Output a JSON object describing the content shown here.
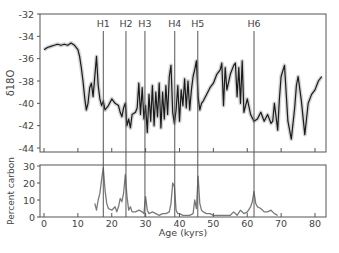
{
  "chart_data": [
    {
      "type": "line",
      "panel": "top",
      "title": "",
      "xlabel": "",
      "ylabel": "δ18O",
      "xlim": [
        0,
        83
      ],
      "ylim": [
        -44.5,
        -32
      ],
      "y_ticks": [
        -32,
        -34,
        -36,
        -38,
        -40,
        -42,
        -44
      ],
      "y_tick_labels": [
        "-32",
        "-34",
        "-36",
        "-38",
        "-40",
        "-42",
        "-44"
      ],
      "grid": false,
      "series": [
        {
          "name": "δ18O",
          "x": [
            0,
            1,
            2,
            3,
            4,
            5,
            6,
            7,
            8,
            9,
            10,
            10.5,
            11,
            11.5,
            12,
            12.5,
            13,
            13.5,
            14,
            14.5,
            15,
            15.5,
            16,
            16.5,
            17,
            17.5,
            18,
            19,
            20,
            21,
            22,
            22.5,
            23,
            23.5,
            24,
            24.5,
            25,
            25.5,
            26,
            27,
            27.5,
            28,
            28.5,
            29,
            29.5,
            30,
            30.5,
            31,
            31.5,
            32,
            32.5,
            33,
            33.5,
            34,
            34.5,
            35,
            35.5,
            36,
            36.5,
            37,
            37.5,
            38,
            38.5,
            39,
            39.5,
            40,
            40.5,
            41,
            41.5,
            42,
            42.5,
            43,
            43.5,
            44,
            44.5,
            45,
            45.5,
            46,
            46.5,
            47,
            48,
            49,
            50,
            51,
            52,
            52.5,
            53,
            53.5,
            54,
            55,
            56,
            56.5,
            57,
            57.5,
            58,
            58.5,
            59,
            60,
            61,
            62,
            63,
            64,
            65,
            66,
            67,
            67.5,
            68,
            69,
            69.5,
            70,
            71,
            72,
            73,
            74,
            74.5,
            75,
            76,
            77,
            78,
            79,
            80,
            81,
            82
          ],
          "values": [
            -35.2,
            -35.0,
            -34.9,
            -34.8,
            -34.7,
            -34.8,
            -34.7,
            -34.8,
            -34.6,
            -34.8,
            -35.2,
            -35.8,
            -36.8,
            -38.0,
            -39.5,
            -40.6,
            -40.0,
            -38.6,
            -38.2,
            -39.4,
            -37.6,
            -35.8,
            -38.4,
            -39.6,
            -40.2,
            -39.8,
            -40.6,
            -40.2,
            -39.6,
            -40.0,
            -40.2,
            -40.8,
            -41.2,
            -40.4,
            -40.0,
            -42.0,
            -41.4,
            -42.2,
            -41.0,
            -40.8,
            -40.4,
            -38.2,
            -41.0,
            -38.6,
            -41.4,
            -40.2,
            -42.6,
            -39.2,
            -41.6,
            -38.4,
            -42.0,
            -39.0,
            -41.2,
            -38.2,
            -42.2,
            -39.0,
            -41.4,
            -38.4,
            -41.0,
            -37.6,
            -36.6,
            -40.8,
            -41.8,
            -40.6,
            -38.4,
            -41.6,
            -38.8,
            -40.2,
            -37.8,
            -40.4,
            -38.0,
            -40.6,
            -38.8,
            -37.6,
            -37.0,
            -36.2,
            -39.4,
            -40.6,
            -40.0,
            -39.8,
            -39.2,
            -38.6,
            -38.2,
            -37.4,
            -37.0,
            -36.4,
            -40.2,
            -36.8,
            -38.8,
            -37.4,
            -36.6,
            -36.4,
            -39.4,
            -36.8,
            -40.0,
            -36.2,
            -40.8,
            -39.6,
            -41.0,
            -41.6,
            -41.4,
            -40.8,
            -41.6,
            -41.0,
            -41.8,
            -41.6,
            -40.0,
            -42.4,
            -39.6,
            -37.6,
            -36.6,
            -41.6,
            -43.2,
            -40.4,
            -38.4,
            -37.6,
            -39.8,
            -42.8,
            -40.0,
            -39.2,
            -38.8,
            -38.0,
            -37.6,
            -37.2,
            -36.8,
            -36.4
          ]
        }
      ],
      "annotations": [
        {
          "label": "H1",
          "x": 17.5
        },
        {
          "label": "H2",
          "x": 24.2
        },
        {
          "label": "H3",
          "x": 29.8
        },
        {
          "label": "H4",
          "x": 38.6
        },
        {
          "label": "H5",
          "x": 45.4
        },
        {
          "label": "H6",
          "x": 62.0
        }
      ]
    },
    {
      "type": "line",
      "panel": "bottom",
      "title": "",
      "xlabel": "Age (kyrs)",
      "ylabel": "Percent carbon",
      "xlim": [
        0,
        83
      ],
      "ylim": [
        0,
        30
      ],
      "x_ticks": [
        0,
        10,
        20,
        30,
        40,
        50,
        60,
        70,
        80
      ],
      "x_tick_labels": [
        "0",
        "10",
        "20",
        "30",
        "40",
        "50",
        "60",
        "70",
        "80"
      ],
      "y_ticks": [
        0,
        10,
        20,
        30
      ],
      "y_tick_labels": [
        "0",
        "10",
        "20",
        "30"
      ],
      "grid": false,
      "series": [
        {
          "name": "Percent carbon",
          "x": [
            15,
            15.5,
            16,
            16.5,
            17,
            17.5,
            18,
            18.5,
            19,
            20,
            21,
            21.5,
            22,
            22.5,
            23,
            23.5,
            24,
            24.5,
            25,
            25.5,
            26,
            27,
            28,
            29,
            29.5,
            30,
            30.5,
            31,
            32,
            33,
            34,
            35,
            36,
            37,
            37.5,
            38,
            38.5,
            39,
            39.5,
            40,
            41,
            42,
            43,
            44,
            44.5,
            45,
            45.5,
            46,
            46.5,
            47,
            48,
            49,
            50,
            52,
            54,
            55,
            56,
            57,
            58,
            59,
            60,
            61,
            61.5,
            62,
            62.5,
            63,
            64,
            65,
            66,
            67,
            68,
            69
          ],
          "values": [
            8,
            4,
            10,
            14,
            22,
            29,
            16,
            8,
            5,
            4,
            6,
            3,
            6,
            11,
            9,
            14,
            25,
            12,
            4,
            6,
            3,
            3,
            4,
            3,
            2,
            12,
            4,
            2,
            3,
            2,
            1,
            2,
            2,
            3,
            8,
            20,
            18,
            4,
            2,
            2,
            1,
            1,
            1,
            2,
            10,
            5,
            24,
            8,
            4,
            3,
            2,
            2,
            1,
            1,
            1,
            1,
            3,
            1,
            4,
            2,
            3,
            6,
            9,
            15,
            8,
            6,
            5,
            3,
            3,
            4,
            2,
            1
          ]
        }
      ]
    }
  ],
  "labels": {
    "top_ylabel": "δ18O",
    "bottom_ylabel": "Percent carbon",
    "xlabel": "Age (kyrs)"
  },
  "colors": {
    "line": "#1a1a1a",
    "envelope": "#c8c8c8",
    "carbon_line": "#7a7a7a",
    "axis": "#555555",
    "marker_line": "#555555"
  }
}
